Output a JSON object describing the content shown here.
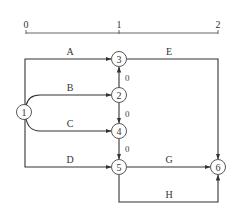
{
  "scale": {
    "ticks": [
      "0",
      "1",
      "2"
    ]
  },
  "nodes": [
    {
      "id": "1",
      "label": "1"
    },
    {
      "id": "2",
      "label": "2"
    },
    {
      "id": "3",
      "label": "3"
    },
    {
      "id": "4",
      "label": "4"
    },
    {
      "id": "5",
      "label": "5"
    },
    {
      "id": "6",
      "label": "6"
    }
  ],
  "edges": [
    {
      "from": "1",
      "to": "3",
      "label": "A"
    },
    {
      "from": "1",
      "to": "2",
      "label": "B"
    },
    {
      "from": "1",
      "to": "4",
      "label": "C"
    },
    {
      "from": "1",
      "to": "5",
      "label": "D"
    },
    {
      "from": "3",
      "to": "6",
      "label": "E"
    },
    {
      "from": "5",
      "to": "6",
      "label": "G"
    },
    {
      "from": "5",
      "to": "6",
      "label": "H"
    },
    {
      "from": "2",
      "to": "3",
      "label": "0"
    },
    {
      "from": "2",
      "to": "4",
      "label": "0"
    },
    {
      "from": "4",
      "to": "5",
      "label": "0"
    }
  ]
}
